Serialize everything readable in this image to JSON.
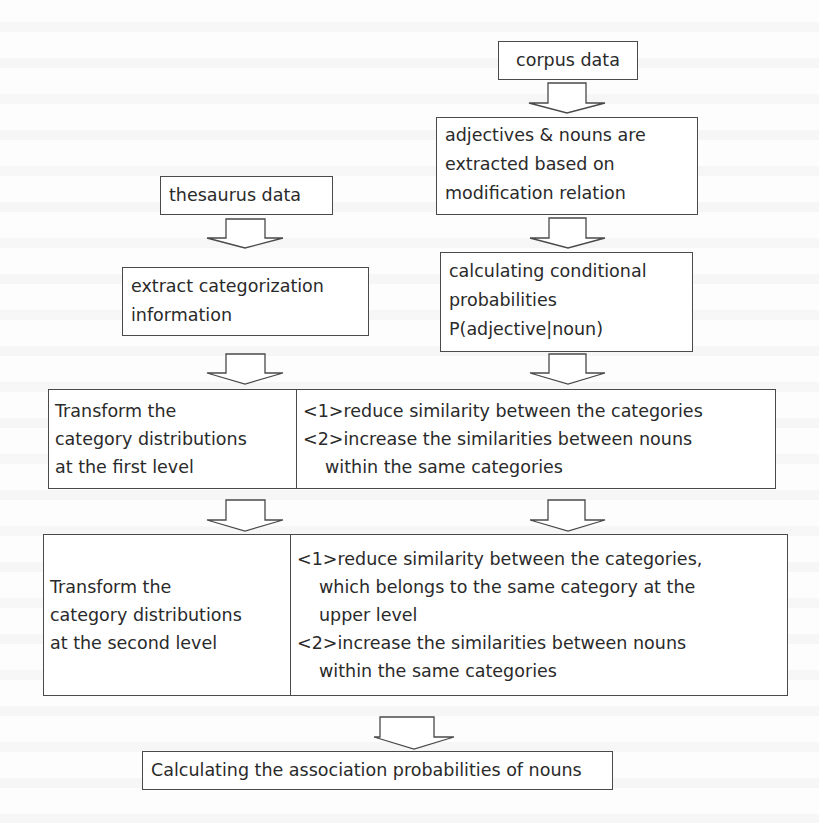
{
  "diagram": {
    "type": "flowchart",
    "nodes": {
      "corpus": {
        "lines": [
          "corpus data"
        ]
      },
      "extract_adj": {
        "lines": [
          "adjectives & nouns are",
          "extracted based on",
          "modification relation"
        ]
      },
      "cond_prob": {
        "lines": [
          "calculating conditional",
          "probabilities",
          "P(adjective|noun)"
        ]
      },
      "thesaurus": {
        "lines": [
          "thesaurus data"
        ]
      },
      "extract_cat": {
        "lines": [
          "extract categorization",
          "information"
        ]
      },
      "level1": {
        "left": {
          "lines": [
            "Transform the",
            "category distributions",
            "at the first level"
          ]
        },
        "right": {
          "lines": [
            "<1>reduce similarity between the categories",
            "<2>increase the similarities between nouns",
            "within the same categories"
          ]
        }
      },
      "level2": {
        "left": {
          "lines": [
            "Transform the",
            "category distributions",
            "at the second level"
          ]
        },
        "right": {
          "lines": [
            "<1>reduce similarity between the categories,",
            "which belongs to the same category at the",
            "upper level",
            "<2>increase the similarities between nouns",
            "within the same categories"
          ]
        }
      },
      "final": {
        "lines": [
          "Calculating the association probabilities of nouns"
        ]
      }
    },
    "edges": [
      {
        "from": "corpus",
        "to": "extract_adj"
      },
      {
        "from": "extract_adj",
        "to": "cond_prob"
      },
      {
        "from": "thesaurus",
        "to": "extract_cat"
      },
      {
        "from": "extract_cat",
        "to": "level1.left"
      },
      {
        "from": "cond_prob",
        "to": "level1.right"
      },
      {
        "from": "level1.left",
        "to": "level2.left"
      },
      {
        "from": "level1.right",
        "to": "level2.right"
      },
      {
        "from": "level2",
        "to": "final"
      }
    ],
    "colors": {
      "stroke": "#4a4a4a",
      "text": "#2a2a2a",
      "background": "#fdfdfd"
    }
  }
}
